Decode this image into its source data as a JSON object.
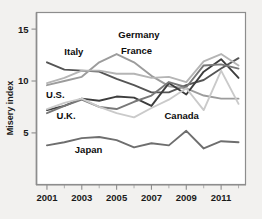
{
  "chart_data": {
    "type": "line",
    "title": "",
    "xlabel": "",
    "ylabel": "Misery index",
    "xlim": [
      2000.4,
      2012.4
    ],
    "ylim": [
      0,
      16.6
    ],
    "grid": false,
    "legend_position": "inline-annotations",
    "x": [
      2001,
      2002,
      2003,
      2004,
      2005,
      2006,
      2007,
      2008,
      2009,
      2010,
      2011,
      2012
    ],
    "xticks": [
      2001,
      2003,
      2005,
      2007,
      2009,
      2011
    ],
    "xtick_labels": [
      "2001",
      "2003",
      "2005",
      "2007",
      "2009",
      "2011"
    ],
    "xticks_minor": [
      2002,
      2004,
      2006,
      2008,
      2010,
      2012
    ],
    "yticks": [
      5,
      10,
      15
    ],
    "ytick_labels": [
      "5",
      "10",
      "15"
    ],
    "series": [
      {
        "name": "Italy",
        "color": "#555555",
        "values": [
          11.8,
          11.1,
          11.0,
          10.9,
          10.2,
          9.6,
          8.9,
          8.9,
          9.6,
          10.1,
          11.2,
          12.2
        ]
      },
      {
        "name": "Germany",
        "color": "#9c9c9c",
        "values": [
          9.6,
          10.0,
          10.4,
          11.8,
          12.6,
          11.8,
          10.5,
          9.5,
          9.3,
          8.6,
          8.3,
          8.3
        ]
      },
      {
        "name": "France",
        "color": "#b5b5b5",
        "values": [
          9.8,
          10.3,
          11.0,
          11.0,
          10.7,
          10.7,
          10.3,
          10.4,
          9.9,
          11.9,
          12.6,
          11.5
        ]
      },
      {
        "name": "U.S.",
        "color": "#3d3d3d",
        "values": [
          7.2,
          7.6,
          8.3,
          8.1,
          8.5,
          8.4,
          7.6,
          9.8,
          8.7,
          10.9,
          12.1,
          10.3
        ]
      },
      {
        "name": "U.K.",
        "color": "#787878",
        "values": [
          6.9,
          7.6,
          8.2,
          7.5,
          7.3,
          8.0,
          8.6,
          9.9,
          9.4,
          11.5,
          11.6,
          11.2
        ]
      },
      {
        "name": "Canada",
        "color": "#cacaca",
        "values": [
          7.3,
          7.9,
          8.3,
          7.5,
          6.9,
          6.5,
          7.4,
          8.2,
          9.3,
          7.2,
          11.0,
          7.8
        ]
      },
      {
        "name": "Japan",
        "color": "#6e6e6e",
        "values": [
          3.8,
          4.1,
          4.5,
          4.6,
          4.3,
          3.6,
          4.0,
          3.8,
          5.2,
          3.5,
          4.2,
          4.1
        ]
      }
    ],
    "annotations": [
      {
        "text": "Germany",
        "x": 2005.1,
        "y": 14.15
      },
      {
        "text": "Italy",
        "x": 2002.0,
        "y": 12.5
      },
      {
        "text": "France",
        "x": 2005.25,
        "y": 12.6
      },
      {
        "text": "U.S.",
        "x": 2000.95,
        "y": 8.35
      },
      {
        "text": "U.K.",
        "x": 2001.55,
        "y": 6.35
      },
      {
        "text": "Canada",
        "x": 2007.75,
        "y": 6.3
      },
      {
        "text": "Japan",
        "x": 2002.6,
        "y": 3.1
      }
    ]
  },
  "colors": {
    "background": "#f2f1ef",
    "plot_background": "#ffffff",
    "axis": "#8d8d8d",
    "text": "#1a1a1a"
  }
}
